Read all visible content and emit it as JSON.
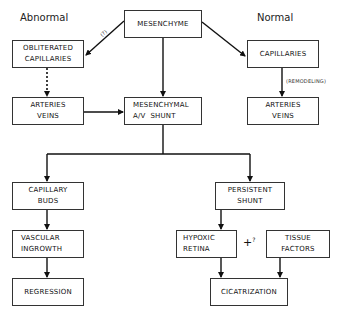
{
  "headings": {
    "abnormal": "Abnormal",
    "normal": "Normal"
  },
  "nodes": {
    "mesenchyme": {
      "lines": [
        "MESENCHYME"
      ]
    },
    "obliterated_capillaries": {
      "lines": [
        "OBLITERATED",
        "CAPILLARIES"
      ]
    },
    "capillaries": {
      "lines": [
        "CAPILLARIES"
      ]
    },
    "arteries_veins_left": {
      "lines": [
        "ARTERIES",
        "VEINS"
      ]
    },
    "mesenchymal_shunt": {
      "lines": [
        "MESENCHYMAL",
        "A/V  SHUNT"
      ]
    },
    "arteries_veins_right": {
      "lines": [
        "ARTERIES",
        "VEINS"
      ]
    },
    "capillary_buds": {
      "lines": [
        "CAPILLARY",
        "BUDS"
      ]
    },
    "vascular_ingrowth": {
      "lines": [
        "VASCULAR",
        "INGROWTH"
      ]
    },
    "regression": {
      "lines": [
        "REGRESSION"
      ]
    },
    "persistent_shunt": {
      "lines": [
        "PERSISTENT",
        "SHUNT"
      ]
    },
    "hypoxic_retina": {
      "lines": [
        "HYPOXIC",
        "RETINA"
      ]
    },
    "tissue_factors": {
      "lines": [
        "TISSUE",
        "FACTORS"
      ]
    },
    "cicatrization": {
      "lines": [
        "CICATRIZATION"
      ]
    }
  },
  "edge_labels": {
    "mesenchyme_to_obliterated": "(?)",
    "remodeling": "(REMODELING)",
    "plus": "+",
    "plus_question": "?"
  },
  "colors": {
    "line": "#111111",
    "box_border": "#333333",
    "background": "#ffffff"
  }
}
